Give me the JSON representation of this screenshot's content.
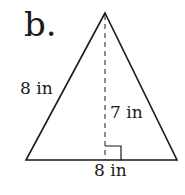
{
  "diagram": {
    "label": "b.",
    "shape": "triangle",
    "side_label": "8 in",
    "height_label": "7 in",
    "base_label": "8 in",
    "colors": {
      "stroke": "#1a1a1a",
      "background": "#ffffff"
    }
  }
}
